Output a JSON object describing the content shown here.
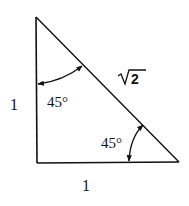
{
  "diagram": {
    "type": "right-triangle",
    "labels": {
      "left_side": "1",
      "bottom_side": "1",
      "hypotenuse_radicand": "2",
      "top_angle": "45°",
      "bottom_angle": "45°"
    },
    "colors": {
      "stroke": "#111111",
      "background": "#ffffff"
    }
  }
}
